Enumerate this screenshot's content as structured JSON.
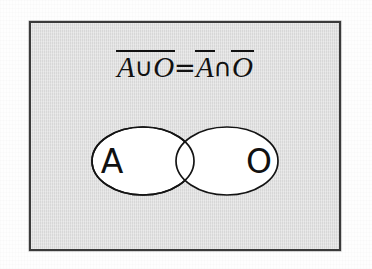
{
  "figure": {
    "kind": "set-theory-venn-diagram",
    "panel_background_color": "#dedede",
    "panel_border_color": "#3a3a3a",
    "ink_color": "#111111",
    "ellipse_fill_color": "#ffffff"
  },
  "formula": {
    "full_text": "A∪O = A∩O (complement of union equals intersection of complements)",
    "left_side": {
      "overbarred_group": true,
      "first_set": "A",
      "operator": "∪",
      "second_set": "O"
    },
    "relation": "=",
    "right_side": {
      "first_set": "A",
      "first_set_overbarred": true,
      "operator": "∩",
      "second_set": "O",
      "second_set_overbarred": true
    }
  },
  "venn": {
    "left_set_label": "A",
    "right_set_label": "O",
    "overlapping": true,
    "region_count": 3
  }
}
